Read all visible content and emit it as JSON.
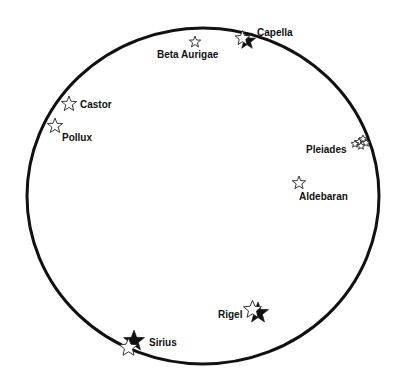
{
  "diagram": {
    "type": "star-map",
    "boundary": {
      "shape": "circle",
      "cx": 203,
      "cy": 196,
      "rx": 176,
      "ry": 168,
      "color": "#111111"
    },
    "stars": [
      {
        "name": "Capella",
        "label": "Capella",
        "x": 247,
        "y": 41,
        "size": 9,
        "style": "filled",
        "overlay_outline": true,
        "label_x": 257,
        "label_y": 36
      },
      {
        "name": "Beta Aurigae",
        "label": "Beta Aurigae",
        "x": 195,
        "y": 42,
        "size": 6,
        "style": "outline",
        "label_x": 157,
        "label_y": 58
      },
      {
        "name": "Castor",
        "label": "Castor",
        "x": 69,
        "y": 104,
        "size": 8,
        "style": "outline",
        "label_x": 80,
        "label_y": 108
      },
      {
        "name": "Pollux",
        "label": "Pollux",
        "x": 55,
        "y": 126,
        "size": 8,
        "style": "outline",
        "label_x": 62,
        "label_y": 141
      },
      {
        "name": "Pleiades",
        "label": "Pleiades",
        "x": 359,
        "y": 142,
        "size": 4,
        "style": "cluster",
        "label_x": 306,
        "label_y": 153
      },
      {
        "name": "Aldebaran",
        "label": "Aldebaran",
        "x": 299,
        "y": 183,
        "size": 7,
        "style": "outline",
        "label_x": 299,
        "label_y": 200
      },
      {
        "name": "Rigel",
        "label": "Rigel",
        "x": 258,
        "y": 313,
        "size": 11,
        "style": "filled",
        "overlay_outline": true,
        "label_x": 218,
        "label_y": 318
      },
      {
        "name": "Sirius",
        "label": "Sirius",
        "x": 134,
        "y": 341,
        "size": 11,
        "style": "filled",
        "overlay_outline": true,
        "label_x": 149,
        "label_y": 346
      }
    ]
  }
}
